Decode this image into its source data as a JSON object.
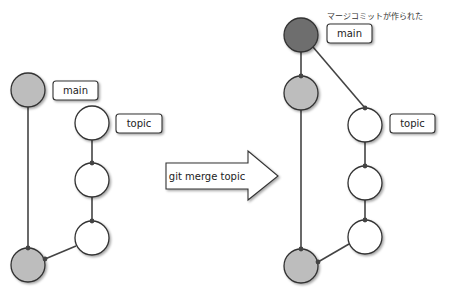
{
  "heading": "",
  "colors": {
    "base_commit": "#bdbdbd",
    "merge_commit": "#6e6e6e",
    "topic_commit": "#ffffff",
    "edge": "#444444",
    "outline": "#333333"
  },
  "left_diagram": {
    "labels": {
      "main": "main",
      "topic": "topic"
    }
  },
  "arrow": {
    "label": "git merge topic"
  },
  "right_diagram": {
    "caption": "マージコミットが作られた",
    "labels": {
      "main": "main",
      "topic": "topic"
    }
  }
}
